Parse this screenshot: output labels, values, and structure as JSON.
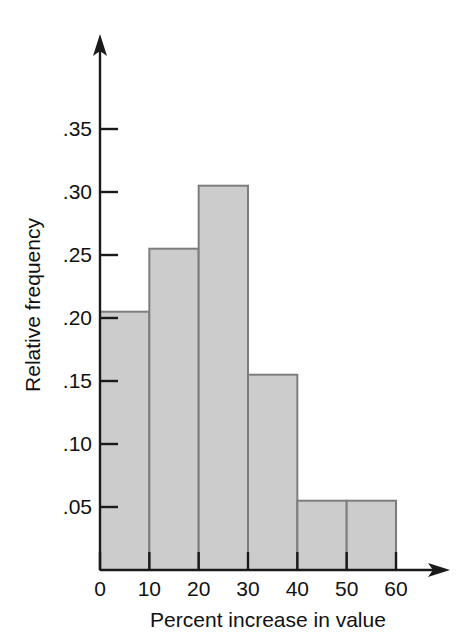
{
  "chart_data": {
    "type": "bar",
    "title": "",
    "subtitle": "",
    "xlabel": "Percent increase in value",
    "ylabel": "Relative frequency",
    "categories": [
      "0-10",
      "10-20",
      "20-30",
      "30-40",
      "40-50",
      "50-60"
    ],
    "bin_edges": [
      0,
      10,
      20,
      30,
      40,
      50,
      60
    ],
    "values": [
      0.205,
      0.255,
      0.305,
      0.155,
      0.055,
      0.055
    ],
    "xlim": [
      0,
      60
    ],
    "ylim": [
      0,
      0.385
    ],
    "x_ticks": [
      0,
      10,
      20,
      30,
      40,
      50,
      60
    ],
    "x_tick_labels": [
      "0",
      "10",
      "20",
      "30",
      "40",
      "50",
      "60"
    ],
    "y_ticks": [
      0.05,
      0.1,
      0.15,
      0.2,
      0.25,
      0.3,
      0.35
    ],
    "y_tick_labels": [
      ".05",
      ".10",
      ".15",
      ".20",
      ".25",
      ".30",
      ".35"
    ],
    "grid": false,
    "legend": null,
    "legend_position": "none",
    "bar_fill_color": "#cccccc",
    "bar_edge_color": "#7d7d7d",
    "axis_color": "#1a1a1a",
    "background_color": "#ffffff",
    "axis_arrows": true,
    "annotations": []
  },
  "figure": {
    "page_background": "#ffffff",
    "left_margin_fragments": ""
  }
}
